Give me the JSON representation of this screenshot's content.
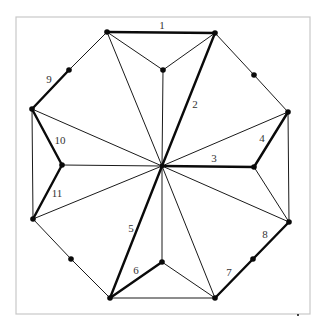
{
  "diagram": {
    "type": "octagon-star-triangulation",
    "colors": {
      "line": "#1a1a1a",
      "frame": "#c8c8c8",
      "label": "#333333"
    },
    "labels": [
      {
        "id": "1",
        "text": "1"
      },
      {
        "id": "2",
        "text": "2"
      },
      {
        "id": "3",
        "text": "3"
      },
      {
        "id": "4",
        "text": "4"
      },
      {
        "id": "5",
        "text": "5"
      },
      {
        "id": "6",
        "text": "6"
      },
      {
        "id": "7",
        "text": "7"
      },
      {
        "id": "8",
        "text": "8"
      },
      {
        "id": "9",
        "text": "9"
      },
      {
        "id": "10",
        "text": "10"
      },
      {
        "id": "11",
        "text": "11"
      }
    ]
  }
}
